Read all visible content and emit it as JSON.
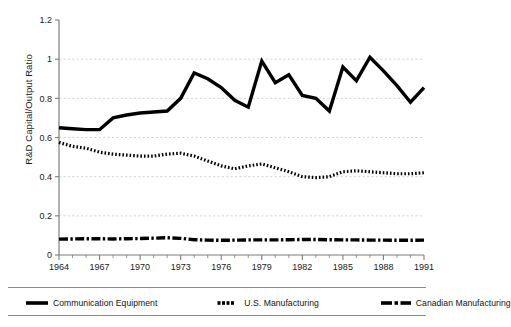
{
  "chart_data": {
    "type": "line",
    "title": "",
    "xlabel": "",
    "ylabel": "R&D Capital/Output Ratio",
    "xlim": [
      1964,
      1991
    ],
    "ylim": [
      0,
      1.2
    ],
    "ytick_values": [
      0,
      0.2,
      0.4,
      0.6,
      0.8,
      1,
      1.2
    ],
    "ytick_labels": [
      "0",
      "0.2",
      "0.4",
      "0.6",
      "0.8",
      "1",
      "1.2"
    ],
    "xtick_labels": [
      "1964",
      "1967",
      "1970",
      "1973",
      "1976",
      "1979",
      "1982",
      "1985",
      "1988",
      "1991"
    ],
    "xtick_values": [
      1964,
      1967,
      1970,
      1973,
      1976,
      1979,
      1982,
      1985,
      1988,
      1991
    ],
    "x": [
      1964,
      1965,
      1966,
      1967,
      1968,
      1969,
      1970,
      1971,
      1972,
      1973,
      1974,
      1975,
      1976,
      1977,
      1978,
      1979,
      1980,
      1981,
      1982,
      1983,
      1984,
      1985,
      1986,
      1987,
      1988,
      1989,
      1990,
      1991
    ],
    "grid": "horizontal-dashed",
    "legend_position": "below",
    "series": [
      {
        "name": "Communication Equipment",
        "style": "solid",
        "color": "#000000",
        "values": [
          0.65,
          0.645,
          0.64,
          0.64,
          0.7,
          0.715,
          0.725,
          0.73,
          0.735,
          0.8,
          0.93,
          0.9,
          0.855,
          0.79,
          0.755,
          0.99,
          0.88,
          0.92,
          0.815,
          0.8,
          0.735,
          0.96,
          0.89,
          1.01,
          0.94,
          0.865,
          0.78,
          0.855
        ]
      },
      {
        "name": "U.S. Manufacturing",
        "style": "dotted",
        "color": "#000000",
        "values": [
          0.575,
          0.555,
          0.545,
          0.525,
          0.515,
          0.51,
          0.505,
          0.505,
          0.515,
          0.52,
          0.505,
          0.48,
          0.455,
          0.44,
          0.455,
          0.465,
          0.445,
          0.425,
          0.4,
          0.395,
          0.4,
          0.425,
          0.43,
          0.425,
          0.42,
          0.415,
          0.415,
          0.42
        ]
      },
      {
        "name": "Canadian Manufacturing",
        "style": "dash-dot",
        "color": "#000000",
        "values": [
          0.081,
          0.082,
          0.083,
          0.083,
          0.082,
          0.083,
          0.084,
          0.086,
          0.088,
          0.085,
          0.078,
          0.076,
          0.075,
          0.076,
          0.077,
          0.077,
          0.077,
          0.078,
          0.079,
          0.079,
          0.078,
          0.077,
          0.077,
          0.076,
          0.076,
          0.075,
          0.075,
          0.076
        ]
      }
    ]
  },
  "legend": {
    "items": [
      {
        "label": "Communication Equipment",
        "marker": "solid-line-swatch"
      },
      {
        "label": "U.S. Manufacturing",
        "marker": "dotted-line-swatch"
      },
      {
        "label": "Canadian Manufacturing",
        "marker": "dash-dot-line-swatch"
      }
    ]
  },
  "footnote": {
    "text": ""
  }
}
